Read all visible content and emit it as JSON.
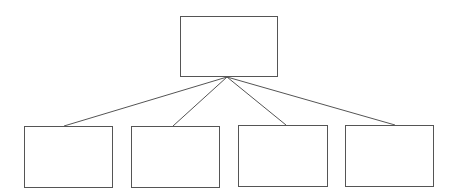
{
  "diagram": {
    "type": "tree",
    "colors": {
      "stroke": "#555555",
      "fill": "#ffffff",
      "background": "#ffffff"
    },
    "root": {
      "id": "root",
      "label": "",
      "x": 180,
      "y": 16,
      "w": 97,
      "h": 60
    },
    "children": [
      {
        "id": "child-1",
        "label": "",
        "x": 24,
        "y": 126,
        "w": 88,
        "h": 61,
        "anchor_x": 64
      },
      {
        "id": "child-2",
        "label": "",
        "x": 131,
        "y": 126,
        "w": 88,
        "h": 61,
        "anchor_x": 173
      },
      {
        "id": "child-3",
        "label": "",
        "x": 238,
        "y": 125,
        "w": 89,
        "h": 61,
        "anchor_x": 286
      },
      {
        "id": "child-4",
        "label": "",
        "x": 345,
        "y": 125,
        "w": 88,
        "h": 61,
        "anchor_x": 395
      }
    ],
    "edges": [
      {
        "from": "root",
        "to": "child-1"
      },
      {
        "from": "root",
        "to": "child-2"
      },
      {
        "from": "root",
        "to": "child-3"
      },
      {
        "from": "root",
        "to": "child-4"
      }
    ],
    "hub": {
      "x": 227,
      "y": 77
    }
  }
}
